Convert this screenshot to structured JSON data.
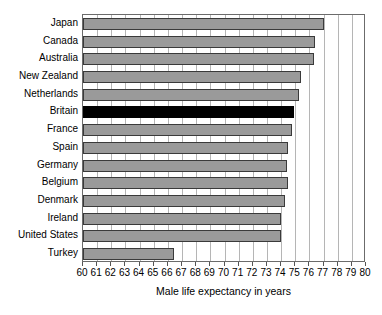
{
  "chart_data": {
    "type": "bar",
    "orientation": "horizontal",
    "title": "",
    "xlabel": "Male life expectancy in years",
    "ylabel": "",
    "xlim": [
      60,
      80
    ],
    "xticks": [
      60,
      61,
      62,
      63,
      64,
      65,
      66,
      67,
      68,
      69,
      70,
      71,
      72,
      73,
      74,
      75,
      76,
      77,
      78,
      79,
      80
    ],
    "xtick_labels": [
      "60",
      "61",
      "62",
      "63",
      "64",
      "65",
      "66",
      "67",
      "68",
      "69",
      "70",
      "71",
      "72",
      "73",
      "74",
      "75",
      "76",
      "77",
      "78",
      "79",
      "80"
    ],
    "grid": "vertical",
    "legend": "none",
    "categories": [
      "Japan",
      "Canada",
      "Australia",
      "New Zealand",
      "Netherlands",
      "Britain",
      "France",
      "Spain",
      "Germany",
      "Belgium",
      "Denmark",
      "Ireland",
      "United States",
      "Turkey"
    ],
    "values": [
      77.0,
      76.4,
      76.3,
      75.4,
      75.3,
      74.9,
      74.8,
      74.5,
      74.4,
      74.5,
      74.3,
      74.0,
      74.0,
      66.4
    ],
    "highlight_category": "Britain",
    "bar_color": "#9a9a9a",
    "bar_edge_color": "#3a3a3a",
    "highlight_color": "#000000",
    "gridline_color": "#b5b5b5",
    "frame_color": "#6b6b6b",
    "background_color": "#ffffff"
  }
}
